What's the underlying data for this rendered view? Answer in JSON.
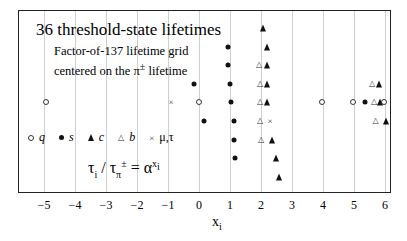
{
  "chart_data": {
    "type": "scatter",
    "title": "36 threshold-state lifetimes",
    "subtitle_lines": [
      "Factor-of-137 lifetime grid",
      "centered on the π± lifetime"
    ],
    "xlabel": "x_i",
    "ylabel": "",
    "xlim": [
      -5.4,
      6.2
    ],
    "xticks": [
      -5,
      -4,
      -3,
      -2,
      -1,
      0,
      1,
      2,
      3,
      4,
      5,
      6
    ],
    "grid": "vertical at integer ticks",
    "formula": "τ_i / τ_π± = α^(x_i)",
    "legend": [
      {
        "key": "q",
        "marker": "open-circle",
        "label": "q"
      },
      {
        "key": "s",
        "marker": "filled-circle",
        "label": "s"
      },
      {
        "key": "c",
        "marker": "filled-triangle",
        "label": "c"
      },
      {
        "key": "b",
        "marker": "open-triangle",
        "label": "b"
      },
      {
        "key": "mutau",
        "marker": "cross",
        "label": "μ,τ"
      }
    ],
    "rows": [
      {
        "y": 28,
        "points": [
          {
            "x": 2.06,
            "type": "c"
          }
        ]
      },
      {
        "y": 47,
        "points": [
          {
            "x": 0.94,
            "type": "s"
          },
          {
            "x": 2.2,
            "type": "c"
          }
        ]
      },
      {
        "y": 65,
        "points": [
          {
            "x": 0.94,
            "type": "s"
          },
          {
            "x": 1.94,
            "type": "b"
          },
          {
            "x": 2.2,
            "type": "c"
          }
        ]
      },
      {
        "y": 84,
        "points": [
          {
            "x": -0.16,
            "type": "s"
          },
          {
            "x": 1.0,
            "type": "s"
          },
          {
            "x": 1.97,
            "type": "b"
          },
          {
            "x": 2.2,
            "type": "c"
          },
          {
            "x": 5.58,
            "type": "b"
          },
          {
            "x": 5.8,
            "type": "c"
          }
        ]
      },
      {
        "y": 102,
        "points": [
          {
            "x": -4.94,
            "type": "q"
          },
          {
            "x": -0.9,
            "type": "mutau"
          },
          {
            "x": 0.0,
            "type": "q"
          },
          {
            "x": 1.03,
            "type": "s"
          },
          {
            "x": 1.97,
            "type": "b"
          },
          {
            "x": 2.2,
            "type": "c"
          },
          {
            "x": 3.97,
            "type": "q"
          },
          {
            "x": 4.97,
            "type": "q"
          },
          {
            "x": 5.35,
            "type": "s"
          },
          {
            "x": 5.65,
            "type": "b"
          },
          {
            "x": 5.84,
            "type": "c"
          },
          {
            "x": 5.97,
            "type": "q"
          }
        ]
      },
      {
        "y": 121,
        "points": [
          {
            "x": 0.16,
            "type": "s"
          },
          {
            "x": 1.13,
            "type": "s"
          },
          {
            "x": 1.97,
            "type": "b"
          },
          {
            "x": 2.29,
            "type": "mutau"
          },
          {
            "x": 5.7,
            "type": "b"
          },
          {
            "x": 6.03,
            "type": "c"
          }
        ]
      },
      {
        "y": 140,
        "points": [
          {
            "x": 1.13,
            "type": "s"
          },
          {
            "x": 2.0,
            "type": "b"
          },
          {
            "x": 2.35,
            "type": "c"
          }
        ]
      },
      {
        "y": 158,
        "points": [
          {
            "x": 1.16,
            "type": "s"
          },
          {
            "x": 2.48,
            "type": "c"
          }
        ]
      },
      {
        "y": 177,
        "points": [
          {
            "x": 2.58,
            "type": "c"
          }
        ]
      }
    ]
  },
  "labels": {
    "title": "36 threshold-state lifetimes",
    "sub1": "Factor-of-137 lifetime grid",
    "sub2_pre": "centered on the ",
    "sub2_pi": "π",
    "sub2_sup": "±",
    "sub2_post": " lifetime",
    "legend_q": "q",
    "legend_s": "s",
    "legend_c": "c",
    "legend_b": "b",
    "legend_x": "μ,τ",
    "xlabel_main": "x",
    "xlabel_sub": "i"
  }
}
